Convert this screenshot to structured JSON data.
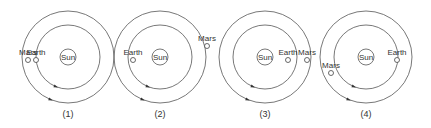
{
  "diagrams": [
    {
      "caption": "(1)",
      "sun_label": "Sun",
      "earth_label": "Earth",
      "mars_label": "Mars",
      "center": [
        68,
        57
      ],
      "earth": [
        36,
        60
      ],
      "mars": [
        28,
        60
      ]
    },
    {
      "caption": "(2)",
      "sun_label": "Sun",
      "earth_label": "Earth",
      "mars_label": "Mars",
      "center": [
        160,
        57
      ],
      "earth": [
        133,
        60
      ],
      "mars": [
        207,
        46
      ]
    },
    {
      "caption": "(3)",
      "sun_label": "Sun",
      "earth_label": "Earth",
      "mars_label": "Mars",
      "center": [
        265,
        57
      ],
      "earth": [
        288,
        60
      ],
      "mars": [
        307,
        60
      ]
    },
    {
      "caption": "(4)",
      "sun_label": "Sun",
      "earth_label": "Earth",
      "mars_label": "Mars",
      "center": [
        366,
        57
      ],
      "earth": [
        397,
        60
      ],
      "mars": [
        331,
        73
      ]
    }
  ],
  "geometry": {
    "sun_radius": 8,
    "earth_orbit_radius": 32,
    "mars_orbit_radius": 46,
    "planet_radius": 2.5
  }
}
